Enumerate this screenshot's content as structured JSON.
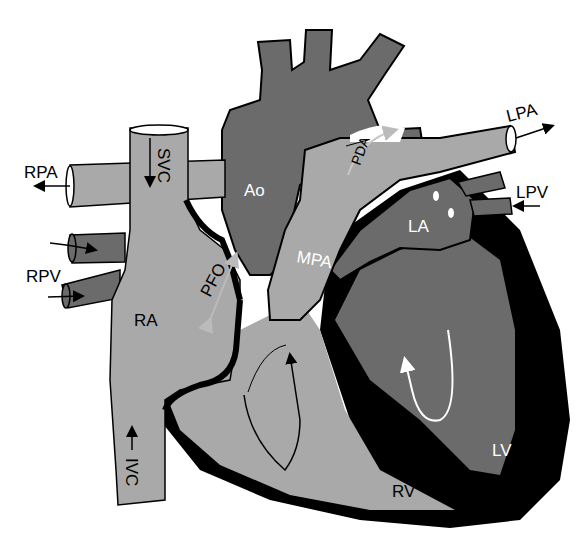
{
  "diagram": {
    "colors": {
      "light_chamber": "#a9a9a9",
      "dark_chamber": "#6b6b6b",
      "wall": "#000000",
      "background": "#ffffff",
      "pfo_arrow": "#b8b8b8",
      "pda_arrow": "#c8c8c8"
    },
    "labels": {
      "rpa": "RPA",
      "svc": "SVC",
      "rpv": "RPV",
      "ra": "RA",
      "pfo": "PFO",
      "ivc": "IVC",
      "ao": "Ao",
      "pda": "PDA",
      "lpa": "LPA",
      "lpv": "LPV",
      "la": "LA",
      "mpa": "MPA",
      "lv": "LV",
      "rv": "RV"
    }
  }
}
